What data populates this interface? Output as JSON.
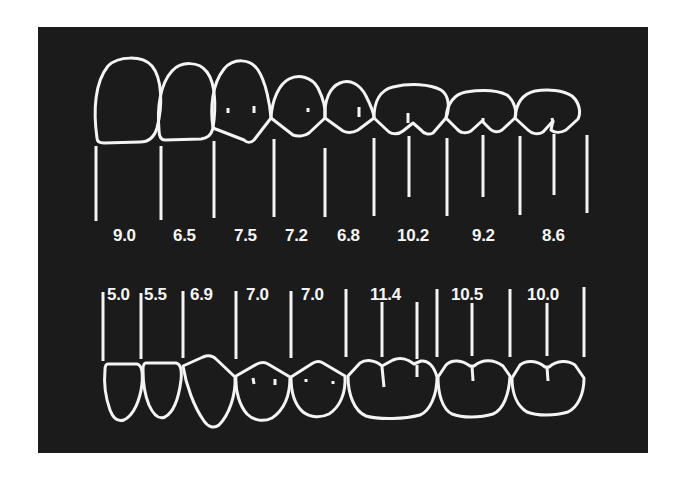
{
  "figure": {
    "title": "",
    "background_color": "#1b1b1b",
    "line_color": "#f4f4f4",
    "units": "mm"
  },
  "upper_arch": {
    "labels": [
      {
        "value": "9.0",
        "x": 130
      },
      {
        "value": "6.5",
        "x": 190
      },
      {
        "value": "7.5",
        "x": 250
      },
      {
        "value": "7.2",
        "x": 300
      },
      {
        "value": "6.8",
        "x": 351
      },
      {
        "value": "10.2",
        "x": 410
      },
      {
        "value": "9.2",
        "x": 485
      },
      {
        "value": "8.6",
        "x": 555
      }
    ]
  },
  "lower_arch": {
    "labels": [
      {
        "value": "5.0",
        "x": 123
      },
      {
        "value": "5.5",
        "x": 161
      },
      {
        "value": "6.9",
        "x": 206
      },
      {
        "value": "7.0",
        "x": 262
      },
      {
        "value": "7.0",
        "x": 317
      },
      {
        "value": "11.4",
        "x": 391
      },
      {
        "value": "10.5",
        "x": 471
      },
      {
        "value": "10.0",
        "x": 547
      }
    ]
  }
}
